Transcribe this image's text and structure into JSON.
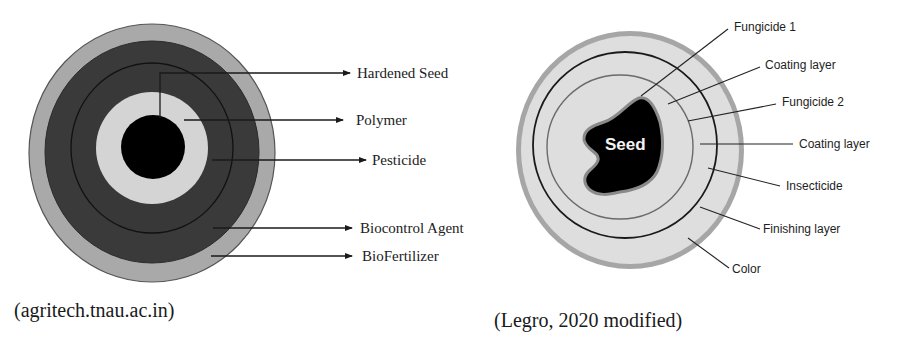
{
  "left_diagram": {
    "labels": [
      {
        "key": "hardened_seed",
        "text": "Hardened Seed"
      },
      {
        "key": "polymer",
        "text": "Polymer"
      },
      {
        "key": "pesticide",
        "text": "Pesticide"
      },
      {
        "key": "biocontrol_agent",
        "text": "Biocontrol Agent"
      },
      {
        "key": "biofertilizer",
        "text": "BioFertilizer"
      }
    ],
    "caption": "(agritech.tnau.ac.in)",
    "colors": {
      "outer_ring": "#a9a9a9",
      "dark_ring": "#3a3a3a",
      "light_ring": "#d4d4d4",
      "core": "#000000"
    }
  },
  "right_diagram": {
    "seed_label": "Seed",
    "labels": [
      {
        "key": "fungicide_1",
        "text": "Fungicide 1"
      },
      {
        "key": "coating_layer_1",
        "text": "Coating layer"
      },
      {
        "key": "fungicide_2",
        "text": "Fungicide 2"
      },
      {
        "key": "coating_layer_2",
        "text": "Coating layer"
      },
      {
        "key": "insecticide",
        "text": "Insecticide"
      },
      {
        "key": "finishing_layer",
        "text": "Finishing layer"
      },
      {
        "key": "color",
        "text": "Color"
      }
    ],
    "caption": "(Legro, 2020 modified)",
    "colors": {
      "outer_border": "#a0a0a0",
      "fill": "#dedede",
      "seed": "#000000"
    }
  }
}
